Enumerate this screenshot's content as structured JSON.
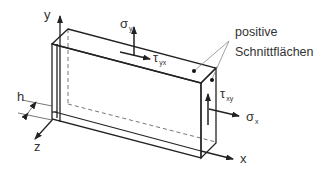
{
  "diagram": {
    "type": "stress-element-plate",
    "axes": {
      "x": "x",
      "y": "y",
      "z": "z"
    },
    "dimension": {
      "thickness_label": "h"
    },
    "stresses": {
      "sigma_y": {
        "symbol": "σ",
        "subscript": "y"
      },
      "tau_yx": {
        "symbol": "τ",
        "subscript": "yx"
      },
      "tau_xy": {
        "symbol": "τ",
        "subscript": "xy"
      },
      "sigma_x": {
        "symbol": "σ",
        "subscript": "x"
      }
    },
    "annotation": {
      "line1": "positive",
      "line2": "Schnittflächen"
    },
    "colors": {
      "line": "#222222",
      "text": "#333333",
      "leader": "#777777",
      "dashed": "#666666"
    }
  }
}
